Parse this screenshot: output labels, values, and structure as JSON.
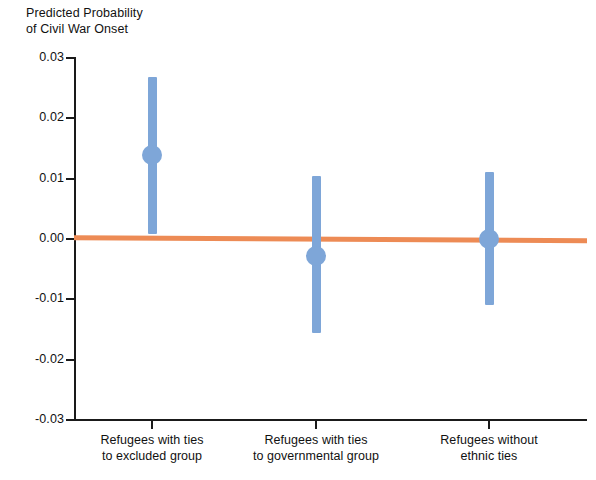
{
  "chart_data": {
    "type": "scatter",
    "title": "",
    "ylabel": "Predicted Probability\nof Civil War Onset",
    "xlabel": "",
    "ylim": [
      -0.03,
      0.03
    ],
    "ytick_labels": [
      "0.03",
      "0.02",
      "0.01",
      "0.00",
      "-0.01",
      "-0.02",
      "-0.03"
    ],
    "ytick_values": [
      0.03,
      0.02,
      0.01,
      0.0,
      -0.01,
      -0.02,
      -0.03
    ],
    "grid": false,
    "legend": "none",
    "categories": [
      "Refugees with ties\nto excluded group",
      "Refugees with ties\nto governmental group",
      "Refugees without\nethnic ties"
    ],
    "values": [
      0.0139,
      -0.0028,
      0.0
    ],
    "ci_low": [
      0.0008,
      -0.0155,
      -0.0109
    ],
    "ci_high": [
      0.0268,
      0.0104,
      0.0111
    ],
    "reference_line": {
      "label": "zero-reference line",
      "y_left": 0.0002,
      "y_right": -0.0003,
      "color": "#ED8B55"
    },
    "marker_color": "#7EA6D8",
    "errorbar_color": "#7EA6D8",
    "axis_color": "#1A1A1A"
  },
  "yaxis": {
    "title": "Predicted Probability\nof Civil War Onset",
    "ticks": [
      {
        "label": "0.03",
        "value": 0.03
      },
      {
        "label": "0.02",
        "value": 0.02
      },
      {
        "label": "0.01",
        "value": 0.01
      },
      {
        "label": "0.00",
        "value": 0.0
      },
      {
        "label": "-0.01",
        "value": -0.01
      },
      {
        "label": "-0.02",
        "value": -0.02
      },
      {
        "label": "-0.03",
        "value": -0.03
      }
    ]
  },
  "xaxis": {
    "categories": [
      {
        "line1": "Refugees with ties",
        "line2": "to excluded group"
      },
      {
        "line1": "Refugees with ties",
        "line2": "to governmental group"
      },
      {
        "line1": "Refugees without",
        "line2": "ethnic ties"
      }
    ]
  },
  "series": {
    "name": "Predicted probability estimates with 95% confidence intervals",
    "points": [
      {
        "category": "Refugees with ties to excluded group",
        "estimate": 0.0139,
        "ci_low": 0.0008,
        "ci_high": 0.0268
      },
      {
        "category": "Refugees with ties to governmental group",
        "estimate": -0.0028,
        "ci_low": -0.0155,
        "ci_high": 0.0104
      },
      {
        "category": "Refugees without ethnic ties",
        "estimate": 0.0,
        "ci_low": -0.0109,
        "ci_high": 0.0111
      }
    ]
  },
  "colors": {
    "marker": "#7EA6D8",
    "errorbar": "#7EA6D8",
    "reference": "#ED8B55",
    "axis": "#1A1A1A",
    "text": "#111111",
    "background": "#FFFFFF"
  }
}
